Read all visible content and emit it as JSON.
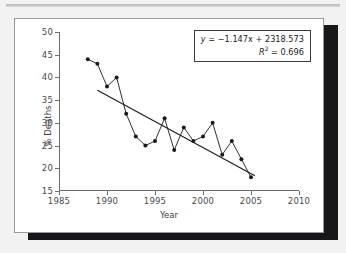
{
  "figure": {
    "background_color": "#f2f2f2",
    "panel_color": "#ffffff",
    "shadow_color": "#17171a",
    "line_color": "#1a1a1a",
    "trend_color": "#1a1a1a",
    "axis_color": "#6d6d6d"
  },
  "annotation": {
    "equation": "y = −1.147x + 2318.573",
    "equation_y": "y",
    "equation_rest": " = −1.147x + 2318.573",
    "r2_symbol": "R",
    "r2_sup": "2",
    "r2_value": " = 0.696",
    "r2_full": "R² = 0.696"
  },
  "chart_data": {
    "type": "line",
    "title": "",
    "subtitle": "",
    "xlabel": "Year",
    "ylabel": "% Deaths",
    "xlim": [
      1985,
      2010
    ],
    "ylim": [
      15,
      50
    ],
    "xticks": [
      1985,
      1990,
      1995,
      2000,
      2005,
      2010
    ],
    "xticklabels": [
      "1985",
      "1990",
      "1995",
      "2000",
      "2005",
      "2010"
    ],
    "yticks": [
      15,
      20,
      25,
      30,
      35,
      40,
      45,
      50
    ],
    "yticklabels": [
      "15",
      "20",
      "25",
      "30",
      "35",
      "40",
      "45",
      "50"
    ],
    "grid": false,
    "legend": null,
    "markers": "filled-circle",
    "x": [
      1988,
      1989,
      1990,
      1991,
      1992,
      1993,
      1994,
      1995,
      1996,
      1997,
      1998,
      1999,
      2000,
      2001,
      2002,
      2003,
      2004,
      2005
    ],
    "values": [
      44,
      43,
      38,
      40,
      32,
      27,
      25,
      26,
      31,
      24,
      29,
      26,
      27,
      30,
      23,
      26,
      22,
      18
    ],
    "series": [
      {
        "name": "% Deaths",
        "x": [
          1988,
          1989,
          1990,
          1991,
          1992,
          1993,
          1994,
          1995,
          1996,
          1997,
          1998,
          1999,
          2000,
          2001,
          2002,
          2003,
          2004,
          2005
        ],
        "values": [
          44,
          43,
          38,
          40,
          32,
          27,
          25,
          26,
          31,
          24,
          29,
          26,
          27,
          30,
          23,
          26,
          22,
          18
        ]
      }
    ],
    "trendline": {
      "type": "linear",
      "slope": -1.147,
      "intercept": 2318.573,
      "r_squared": 0.696,
      "x_start": 1989,
      "x_end": 2005.4,
      "equation_text": "y = −1.147x + 2318.573",
      "r2_text": "R² = 0.696"
    }
  }
}
